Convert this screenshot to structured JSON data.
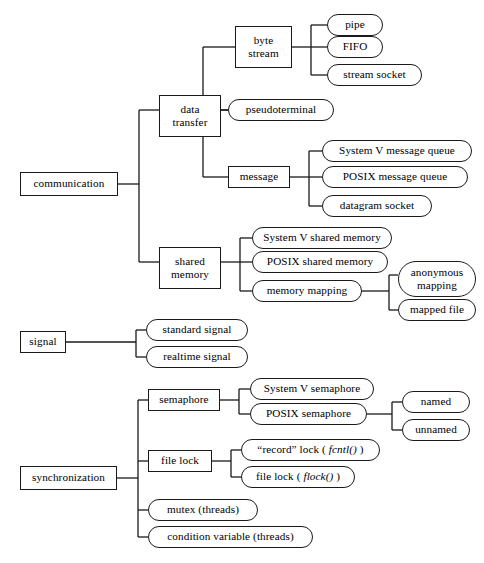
{
  "diagram": {
    "background_color": "#ffffff",
    "line_color": "#1a1a1a",
    "text_color": "#000000",
    "rect_node_shape": "rectangle",
    "leaf_node_shape": "rounded-stadium"
  },
  "nodes": {
    "communication": "communication",
    "data_transfer": "data\ntransfer",
    "data_transfer_l1": "data",
    "data_transfer_l2": "transfer",
    "byte_stream_l1": "byte",
    "byte_stream_l2": "stream",
    "pipe": "pipe",
    "fifo": "FIFO",
    "stream_socket": "stream socket",
    "pseudoterminal": "pseudoterminal",
    "message": "message",
    "sysv_message_queue": "System V message queue",
    "posix_message_queue": "POSIX message queue",
    "datagram_socket": "datagram socket",
    "shared_memory_l1": "shared",
    "shared_memory_l2": "memory",
    "sysv_shared_memory": "System V shared memory",
    "posix_shared_memory": "POSIX shared memory",
    "memory_mapping": "memory mapping",
    "anonymous_mapping_l1": "anonymous",
    "anonymous_mapping_l2": "mapping",
    "mapped_file": "mapped file",
    "signal": "signal",
    "standard_signal": "standard signal",
    "realtime_signal": "realtime signal",
    "synchronization": "synchronization",
    "semaphore": "semaphore",
    "sysv_semaphore": "System V semaphore",
    "posix_semaphore": "POSIX semaphore",
    "named": "named",
    "unnamed": "unnamed",
    "file_lock": "file lock",
    "record_lock_prefix": "“record” lock ( ",
    "record_lock_fn": "fcntl()",
    "record_lock_suffix": " )",
    "flock_prefix": "file lock ( ",
    "flock_fn": "flock()",
    "flock_suffix": " )",
    "mutex_threads": "mutex (threads)",
    "condition_variable_threads": "condition variable (threads)"
  }
}
